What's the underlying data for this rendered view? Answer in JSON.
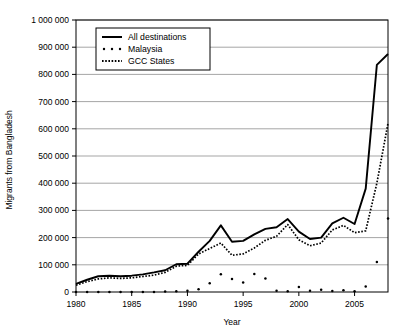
{
  "chart_data": {
    "type": "line",
    "title": "",
    "xlabel": "Year",
    "ylabel": "Migrants from Bangladesh",
    "xlim": [
      1980,
      2008
    ],
    "ylim": [
      0,
      1000000
    ],
    "grid": true,
    "legend_position": "top-left",
    "y_ticks": [
      "0",
      "100 000",
      "200 000",
      "300 000",
      "400 000",
      "500 000",
      "600 000",
      "700 000",
      "800 000",
      "900 000",
      "1 000 000"
    ],
    "y_tick_values": [
      0,
      100000,
      200000,
      300000,
      400000,
      500000,
      600000,
      700000,
      800000,
      900000,
      1000000
    ],
    "x_ticks": [
      "1980",
      "1985",
      "1990",
      "1995",
      "2000",
      "2005"
    ],
    "x_tick_values": [
      1980,
      1985,
      1990,
      1995,
      2000,
      2005
    ],
    "x": [
      1980,
      1981,
      1982,
      1983,
      1984,
      1985,
      1986,
      1987,
      1988,
      1989,
      1990,
      1991,
      1992,
      1993,
      1994,
      1995,
      1996,
      1997,
      1998,
      1999,
      2000,
      2001,
      2002,
      2003,
      2004,
      2005,
      2006,
      2007,
      2008
    ],
    "series": [
      {
        "name": "All destinations",
        "style": "solid-line",
        "values": [
          30000,
          45000,
          58000,
          60000,
          58000,
          60000,
          65000,
          72000,
          80000,
          102000,
          104000,
          148000,
          188000,
          245000,
          185000,
          188000,
          212000,
          232000,
          238000,
          268000,
          222000,
          195000,
          200000,
          252000,
          273000,
          250000,
          380000,
          835000,
          875000
        ]
      },
      {
        "name": "Malaysia",
        "style": "sparse-dots",
        "values": [
          0,
          0,
          0,
          0,
          0,
          0,
          0,
          0,
          2000,
          3000,
          5000,
          10000,
          32000,
          65000,
          48000,
          35000,
          66000,
          50000,
          5000,
          3000,
          18000,
          5000,
          8000,
          4000,
          6000,
          3000,
          20000,
          110000,
          270000
        ]
      },
      {
        "name": "GCC States",
        "style": "dense-dots",
        "values": [
          25000,
          38000,
          48000,
          52000,
          50000,
          52000,
          57000,
          62000,
          72000,
          95000,
          98000,
          140000,
          160000,
          180000,
          135000,
          140000,
          162000,
          190000,
          205000,
          248000,
          192000,
          170000,
          180000,
          228000,
          245000,
          218000,
          225000,
          400000,
          620000
        ]
      }
    ]
  },
  "legend": {
    "entries": [
      {
        "label": "All destinations"
      },
      {
        "label": "Malaysia"
      },
      {
        "label": "GCC States"
      }
    ]
  },
  "colors": {
    "line": "#000000",
    "grid": "#808080",
    "frame": "#000000",
    "background": "#ffffff"
  }
}
